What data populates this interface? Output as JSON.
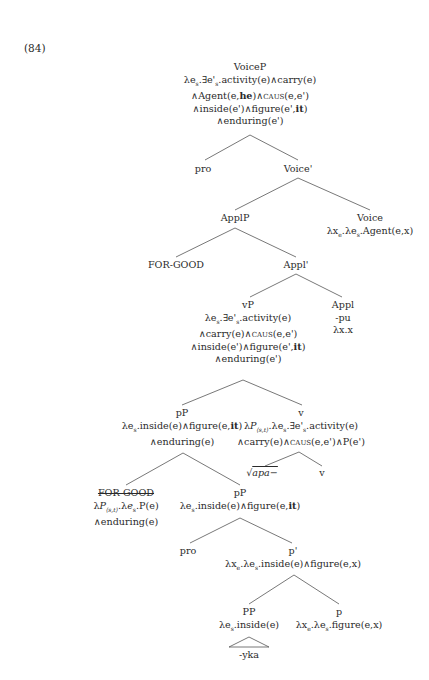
{
  "example_number": "(84)",
  "tree": {
    "voiceP": {
      "label": "VoiceP",
      "sem": [
        "λeₛ.∃e'ₛ.activity(e)∧carry(e)",
        "∧Agent(e,|he|)∧|CAUS|(e,e')",
        "∧inside(e')∧figure(e',|it|)",
        "∧enduring(e')"
      ]
    },
    "pro_top": {
      "label": "pro"
    },
    "voice_bar": {
      "label": "Voice'"
    },
    "applP": {
      "label": "ApplP"
    },
    "voice": {
      "label": "Voice",
      "sem": "λxₑ.λeₛ.Agent(e,x)"
    },
    "for_good_top": {
      "label": "FOR-GOOD"
    },
    "appl_bar": {
      "label": "Appl'"
    },
    "vP": {
      "label": "vP",
      "sem": [
        "λeₛ.∃e'ₛ.activity(e)",
        "∧carry(e)∧CAUS(e,e')",
        "∧inside(e')∧figure(e',it)",
        "∧enduring(e')"
      ]
    },
    "appl": {
      "label": "Appl",
      "morph": "-pu",
      "sem": "λx.x"
    },
    "pP_upper": {
      "label": "pP",
      "sem": [
        "λeₛ.inside(e)∧figure(e,it)",
        "∧enduring(e)"
      ]
    },
    "v": {
      "label": "v",
      "sem": [
        "λP₍ₛ,ₜ₎.λeₛ.∃e'ₛ.activity(e)",
        "∧carry(e)∧CAUS(e,e')∧P(e')"
      ]
    },
    "root": {
      "label": "√apa−"
    },
    "v_head": {
      "label": "v"
    },
    "for_good_low": {
      "label": "FOR-GOOD",
      "sem": [
        "λP₍ₛ,ₜ₎.λeₛ.P(e)",
        "∧enduring(e)"
      ]
    },
    "pP_lower": {
      "label": "pP",
      "sem": "λeₛ.inside(e)∧figure(e,it)"
    },
    "pro_low": {
      "label": "pro"
    },
    "p_bar": {
      "label": "p'",
      "sem": "λxₑ.λeₛ.inside(e)∧figure(e,x)"
    },
    "PP": {
      "label": "PP",
      "sem": "λeₛ.inside(e)"
    },
    "p": {
      "label": "p",
      "sem": "λxₑ.λeₛ.figure(e,x)"
    },
    "yka": {
      "label": "-yka"
    }
  }
}
